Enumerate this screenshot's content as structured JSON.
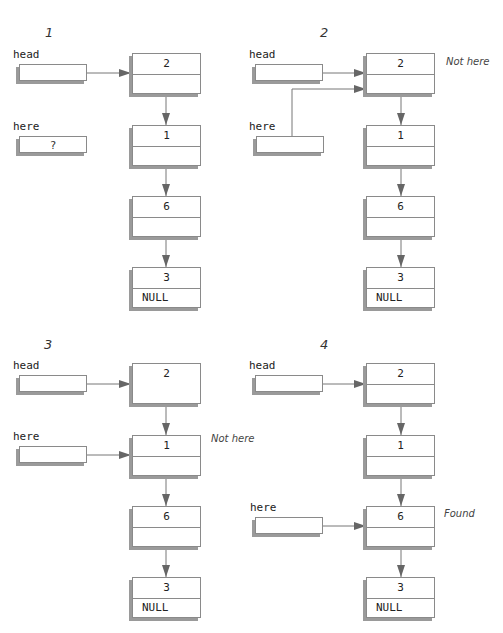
{
  "panels": [
    {
      "title": "1",
      "head_label": "head",
      "here_label": "here",
      "here_value": "?",
      "nodes": [
        {
          "value": "2",
          "next": ""
        },
        {
          "value": "1",
          "next": ""
        },
        {
          "value": "6",
          "next": ""
        },
        {
          "value": "3",
          "next": "NULL"
        }
      ],
      "note": ""
    },
    {
      "title": "2",
      "head_label": "head",
      "here_label": "here",
      "here_value": "",
      "nodes": [
        {
          "value": "2",
          "next": ""
        },
        {
          "value": "1",
          "next": ""
        },
        {
          "value": "6",
          "next": ""
        },
        {
          "value": "3",
          "next": "NULL"
        }
      ],
      "note": "Not here"
    },
    {
      "title": "3",
      "head_label": "head",
      "here_label": "here",
      "here_value": "",
      "nodes": [
        {
          "value": "2",
          "next": ""
        },
        {
          "value": "1",
          "next": ""
        },
        {
          "value": "6",
          "next": ""
        },
        {
          "value": "3",
          "next": "NULL"
        }
      ],
      "note": "Not here"
    },
    {
      "title": "4",
      "head_label": "head",
      "here_label": "here",
      "here_value": "",
      "nodes": [
        {
          "value": "2",
          "next": ""
        },
        {
          "value": "1",
          "next": ""
        },
        {
          "value": "6",
          "next": ""
        },
        {
          "value": "3",
          "next": "NULL"
        }
      ],
      "note": "Found"
    }
  ],
  "colors": {
    "border": "#8a8a8a",
    "shadow": "#9a9a9a",
    "arrow": "#666666"
  }
}
